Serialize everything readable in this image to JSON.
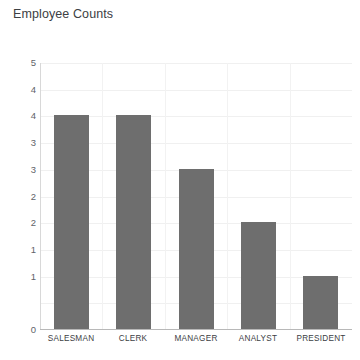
{
  "chart_data": {
    "type": "bar",
    "title": "Employee Counts",
    "xlabel": "",
    "ylabel": "",
    "categories": [
      "SALESMAN",
      "CLERK",
      "MANAGER",
      "ANALYST",
      "PRESIDENT"
    ],
    "values": [
      4,
      4,
      3,
      2,
      1
    ],
    "series": [
      {
        "name": "Employee Counts",
        "values": [
          4,
          4,
          3,
          2,
          1
        ]
      }
    ],
    "ylim": [
      0,
      5
    ],
    "y_tick_positions": [
      5,
      4.5,
      4,
      3.5,
      3,
      2.5,
      2,
      1.5,
      1,
      0.5,
      0
    ],
    "y_tick_labels": [
      "5",
      "4",
      "4",
      "3",
      "3",
      "2",
      "2",
      "1",
      "1",
      "",
      "0"
    ],
    "grid": true,
    "grid_horizontal": true,
    "grid_vertical": true,
    "legend": false,
    "legend_position": "none",
    "bar_color": "#6e6e6e",
    "background_color": "#ffffff",
    "grid_color": "#f0f0f0",
    "axis_color": "#b8b8b8",
    "title_color": "#3c4043",
    "tick_label_color": "#5f6368"
  }
}
